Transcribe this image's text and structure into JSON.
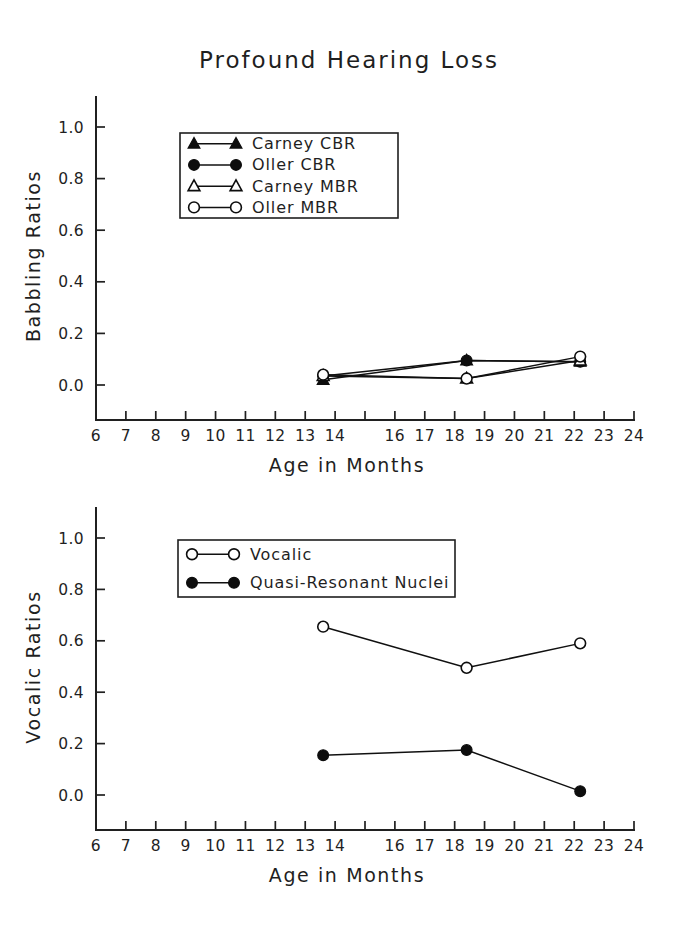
{
  "figure": {
    "title": "Profound Hearing Loss",
    "width": 698,
    "height": 935
  },
  "chart_data": [
    {
      "type": "line",
      "panel": "top",
      "title": "Profound Hearing Loss",
      "xlabel": "Age in Months",
      "ylabel": "Babbling Ratios",
      "xlim": [
        6,
        24
      ],
      "ylim": [
        0.0,
        1.0
      ],
      "grid": false,
      "legend_position": "upper-left-inside",
      "xticks": [
        6,
        7,
        8,
        9,
        10,
        11,
        12,
        13,
        14,
        15,
        16,
        17,
        18,
        19,
        20,
        21,
        22,
        23,
        24
      ],
      "xticklabels": [
        "6",
        "7",
        "8",
        "9",
        "10",
        "11",
        "12",
        "13",
        "14",
        "",
        "16",
        "17",
        "18",
        "19",
        "20",
        "21",
        "22",
        "23",
        "24"
      ],
      "yticks": [
        0.0,
        0.2,
        0.4,
        0.6,
        0.8,
        1.0
      ],
      "yticklabels": [
        "0.0",
        "0.2",
        "0.4",
        "0.6",
        "0.8",
        "1.0"
      ],
      "series": [
        {
          "name": "Carney CBR",
          "marker": "triangle-filled",
          "x": [
            13.6,
            18.4,
            22.2
          ],
          "values": [
            0.02,
            0.095,
            0.09
          ]
        },
        {
          "name": "Oller CBR",
          "marker": "circle-filled",
          "x": [
            13.6,
            18.4,
            22.2
          ],
          "values": [
            0.035,
            0.095,
            0.09
          ]
        },
        {
          "name": "Carney MBR",
          "marker": "triangle-open",
          "x": [
            13.6,
            18.4,
            22.2
          ],
          "values": [
            0.035,
            0.025,
            0.095
          ]
        },
        {
          "name": "Oller MBR",
          "marker": "circle-open",
          "x": [
            13.6,
            18.4,
            22.2
          ],
          "values": [
            0.04,
            0.025,
            0.11
          ]
        }
      ]
    },
    {
      "type": "line",
      "panel": "bottom",
      "title": "",
      "xlabel": "Age in Months",
      "ylabel": "Vocalic Ratios",
      "xlim": [
        6,
        24
      ],
      "ylim": [
        0.0,
        1.0
      ],
      "grid": false,
      "legend_position": "upper-left-inside",
      "xticks": [
        6,
        7,
        8,
        9,
        10,
        11,
        12,
        13,
        14,
        15,
        16,
        17,
        18,
        19,
        20,
        21,
        22,
        23,
        24
      ],
      "xticklabels": [
        "6",
        "7",
        "8",
        "9",
        "10",
        "11",
        "12",
        "13",
        "14",
        "",
        "16",
        "17",
        "18",
        "19",
        "20",
        "21",
        "22",
        "23",
        "24"
      ],
      "yticks": [
        0.0,
        0.2,
        0.4,
        0.6,
        0.8,
        1.0
      ],
      "yticklabels": [
        "0.0",
        "0.2",
        "0.4",
        "0.6",
        "0.8",
        "1.0"
      ],
      "series": [
        {
          "name": "Vocalic",
          "marker": "circle-open",
          "x": [
            13.6,
            18.4,
            22.2
          ],
          "values": [
            0.655,
            0.495,
            0.59
          ]
        },
        {
          "name": "Quasi-Resonant Nuclei",
          "marker": "circle-filled",
          "x": [
            13.6,
            18.4,
            22.2
          ],
          "values": [
            0.155,
            0.175,
            0.015
          ]
        }
      ]
    }
  ],
  "colors": {
    "ink": "#101010",
    "background": "#ffffff"
  }
}
